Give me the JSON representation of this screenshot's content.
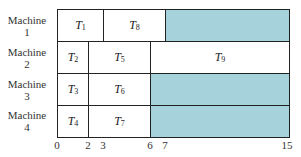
{
  "diagram": {
    "type": "gantt-schedule",
    "axis": {
      "min": 0,
      "max": 15,
      "ticks": [
        "0",
        "2",
        "3",
        "6",
        "7",
        "15"
      ]
    },
    "machines": [
      {
        "label_line1": "Machine",
        "label_line2": "1",
        "tasks": [
          {
            "name": "T",
            "sub": "1",
            "start": 0,
            "end": 3
          },
          {
            "name": "T",
            "sub": "8",
            "start": 3,
            "end": 7
          },
          {
            "name": "",
            "sub": "",
            "start": 7,
            "end": 15,
            "idle": true
          }
        ]
      },
      {
        "label_line1": "Machine",
        "label_line2": "2",
        "tasks": [
          {
            "name": "T",
            "sub": "2",
            "start": 0,
            "end": 2
          },
          {
            "name": "T",
            "sub": "5",
            "start": 2,
            "end": 6
          },
          {
            "name": "T",
            "sub": "9",
            "start": 6,
            "end": 15
          }
        ]
      },
      {
        "label_line1": "Machine",
        "label_line2": "3",
        "tasks": [
          {
            "name": "T",
            "sub": "3",
            "start": 0,
            "end": 2
          },
          {
            "name": "T",
            "sub": "6",
            "start": 2,
            "end": 6
          },
          {
            "name": "",
            "sub": "",
            "start": 6,
            "end": 15,
            "idle": true
          }
        ]
      },
      {
        "label_line1": "Machine",
        "label_line2": "4",
        "tasks": [
          {
            "name": "T",
            "sub": "4",
            "start": 0,
            "end": 2
          },
          {
            "name": "T",
            "sub": "7",
            "start": 2,
            "end": 6
          },
          {
            "name": "",
            "sub": "",
            "start": 6,
            "end": 15,
            "idle": true
          }
        ]
      }
    ],
    "colors": {
      "idle": "#a6d3db",
      "border": "#222222",
      "task": "#ffffff"
    }
  }
}
